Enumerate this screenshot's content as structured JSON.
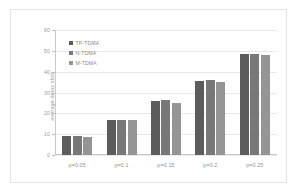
{
  "chart_data": {
    "type": "bar",
    "title": "",
    "subtitle": "",
    "xlabel": "",
    "ylabel": "average delay slots",
    "categories": [
      "p=0.05",
      "p=0.1",
      "p=0.15",
      "p=0.2",
      "p=0.25"
    ],
    "series": [
      {
        "name": "TP-TDMA",
        "values": [
          9,
          17,
          26,
          35.5,
          48.5
        ],
        "color": "#5c5c5c"
      },
      {
        "name": "N-TDMA",
        "values": [
          9,
          17,
          26.5,
          36,
          48.5
        ],
        "color": "#787878"
      },
      {
        "name": "M-TDMA",
        "values": [
          8.8,
          16.8,
          25,
          35,
          48
        ],
        "color": "#959595"
      }
    ],
    "ylim": [
      0,
      60
    ],
    "yticks": [
      0,
      10,
      20,
      30,
      40,
      50,
      60
    ],
    "ytick_labels": [
      "0",
      "10",
      "20",
      "30",
      "40",
      "50",
      "60"
    ],
    "grid": true,
    "grid_axis": "y",
    "legend_position": "upper-left-inside",
    "plot_background": "#ffffff",
    "grid_color": "#e9e9e9",
    "axis_color": "#c9c9c9",
    "text_color": "#9a9a9a"
  }
}
